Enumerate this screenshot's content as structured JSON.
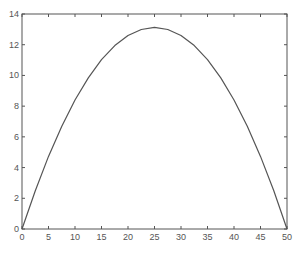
{
  "chart_data": {
    "type": "line",
    "title": "",
    "xlabel": "",
    "ylabel": "",
    "xlim": [
      0,
      50
    ],
    "ylim": [
      0,
      14
    ],
    "grid": false,
    "legend": null,
    "xticks": [
      0,
      5,
      10,
      15,
      20,
      25,
      30,
      35,
      40,
      45,
      50
    ],
    "yticks": [
      0,
      2,
      4,
      6,
      8,
      10,
      12,
      14
    ],
    "series": [
      {
        "name": "curve",
        "color": "#555555",
        "x": [
          0,
          2.5,
          5,
          7.5,
          10,
          12.5,
          15,
          17.5,
          20,
          22.5,
          25,
          27.5,
          30,
          32.5,
          35,
          37.5,
          40,
          42.5,
          45,
          47.5,
          50
        ],
        "values": [
          0,
          2.49,
          4.73,
          6.69,
          8.4,
          9.84,
          11.03,
          11.94,
          12.6,
          12.99,
          13.13,
          12.99,
          12.6,
          11.94,
          11.03,
          9.84,
          8.4,
          6.69,
          4.73,
          2.49,
          0
        ]
      }
    ]
  },
  "colors": {
    "axes": "#555555",
    "background": "#ffffff"
  }
}
